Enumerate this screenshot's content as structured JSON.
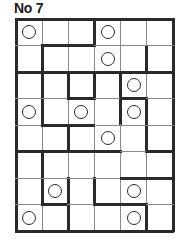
{
  "puzzle": {
    "title": "No 7",
    "rows": 8,
    "cols": 6,
    "circles": [
      [
        0,
        0
      ],
      [
        0,
        3
      ],
      [
        1,
        3
      ],
      [
        2,
        4
      ],
      [
        3,
        0
      ],
      [
        3,
        2
      ],
      [
        3,
        4
      ],
      [
        4,
        3
      ],
      [
        6,
        1
      ],
      [
        6,
        4
      ],
      [
        7,
        0
      ],
      [
        7,
        4
      ]
    ]
  }
}
